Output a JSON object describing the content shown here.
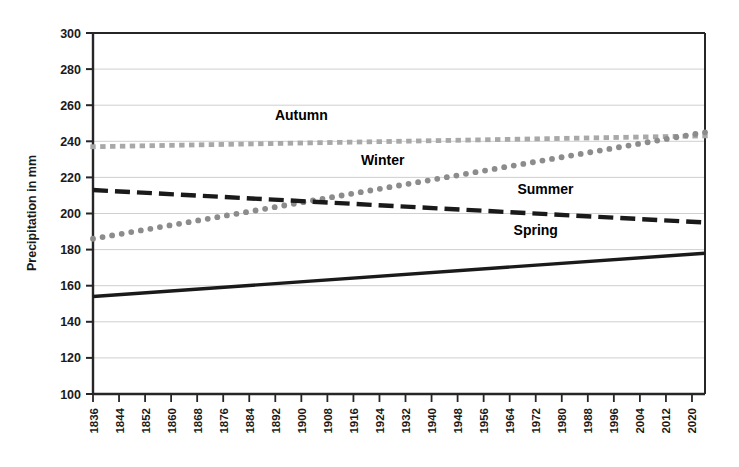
{
  "chart_data": {
    "type": "line",
    "title": "",
    "xlabel": "",
    "ylabel": "Precipitation in mm",
    "ylim": [
      100,
      300
    ],
    "ytick_step": 20,
    "yticks": [
      100,
      120,
      140,
      160,
      180,
      200,
      220,
      240,
      260,
      280,
      300
    ],
    "xlim": [
      1836,
      2024
    ],
    "xticks": [
      1836,
      1844,
      1852,
      1860,
      1868,
      1876,
      1884,
      1892,
      1900,
      1908,
      1916,
      1924,
      1932,
      1940,
      1948,
      1956,
      1964,
      1972,
      1980,
      1988,
      1996,
      2004,
      2012,
      2020
    ],
    "xtick_labels": [
      "1836",
      "1844",
      "1852",
      "1860",
      "1868",
      "1876",
      "1884",
      "1892",
      "1900",
      "1908",
      "1916",
      "1924",
      "1932",
      "1940",
      "1948",
      "1956",
      "1964",
      "1972",
      "1980",
      "1988",
      "1996",
      "2004",
      "2012",
      "2020"
    ],
    "grid": true,
    "grid_axis": "y",
    "legend": "inline-annotations",
    "series": [
      {
        "name": "Autumn",
        "style": "square-dotted",
        "color": "#a8a8a8",
        "label_x": 1900,
        "label_y": 252,
        "x": [
          1836,
          2024
        ],
        "values": [
          237,
          243
        ]
      },
      {
        "name": "Winter",
        "style": "round-dotted",
        "color": "#8c8c8c",
        "label_x": 1925,
        "label_y": 227,
        "x": [
          1836,
          2024
        ],
        "values": [
          186,
          245
        ]
      },
      {
        "name": "Summer",
        "style": "dashed",
        "color": "#1a1a1a",
        "label_x": 1975,
        "label_y": 211,
        "x": [
          1836,
          2024
        ],
        "values": [
          213,
          195
        ]
      },
      {
        "name": "Spring",
        "style": "solid",
        "color": "#1a1a1a",
        "label_x": 1972,
        "label_y": 188,
        "x": [
          1836,
          2024
        ],
        "values": [
          154,
          178
        ]
      }
    ],
    "annotations": [
      {
        "text": "Autumn",
        "series": "Autumn"
      },
      {
        "text": "Winter",
        "series": "Winter"
      },
      {
        "text": "Summer",
        "series": "Summer"
      },
      {
        "text": "Spring",
        "series": "Spring"
      }
    ]
  }
}
